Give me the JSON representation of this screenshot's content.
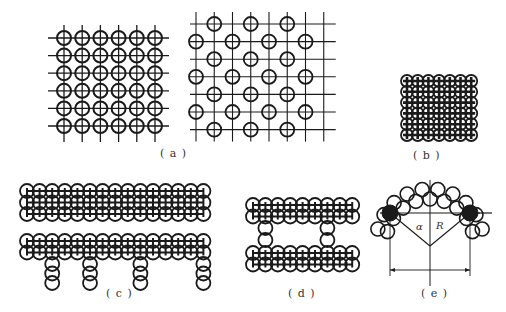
{
  "figure": {
    "background": "#ffffff",
    "stroke": "#1a1a1a",
    "panels": [
      {
        "id": "a",
        "label": "( a )",
        "description": "Square grid arrangements: dense 6x6 and staggered grid"
      },
      {
        "id": "b",
        "label": "( b )",
        "description": "Closely packed 6x6 circle array"
      },
      {
        "id": "c",
        "label": "( c )",
        "description": "Three-row strip and two-row strip with four legs"
      },
      {
        "id": "d",
        "label": "( d )",
        "description": "Two double-row strips connected by two vertical legs"
      },
      {
        "id": "e",
        "label": "( e )",
        "description": "Circles arranged along an arc of radius R with angle alpha"
      }
    ],
    "annotations": {
      "alpha": "α",
      "radius": "R"
    },
    "params": {
      "a_left": {
        "x0": 64,
        "y0": 38,
        "dx": 18.2,
        "dy": 17.6,
        "cols": 6,
        "rows": 6,
        "r": 7
      },
      "a_right": {
        "x0": 196,
        "y0": 24,
        "dx": 36.5,
        "dy": 17.6,
        "cols": 4,
        "rows": 7,
        "r": 7
      },
      "b": {
        "x0": 407,
        "y0": 81,
        "dx": 10.7,
        "dy": 10.8,
        "cols": 7,
        "rows": 6,
        "r": 6
      },
      "c_top": {
        "x0": 27,
        "y0": 191,
        "dx": 12.6,
        "dy": 11.5,
        "cols": 15,
        "rows": 3,
        "r": 7
      },
      "c_bot": {
        "x0": 27,
        "y0": 241,
        "dx": 12.6,
        "dy": 11.5,
        "cols": 15,
        "rows": 2,
        "r": 7,
        "legs": [
          2,
          5,
          9,
          14
        ],
        "leg_len": 3
      },
      "d_top": {
        "x0": 253,
        "y0": 205,
        "dx": 12.4,
        "dy": 11.5,
        "cols": 9,
        "rows": 2,
        "r": 7
      },
      "d_bot": {
        "x0": 253,
        "y0": 253,
        "dx": 12.4,
        "dy": 11.5,
        "cols": 9,
        "rows": 2,
        "r": 7,
        "legs": [
          1,
          6
        ],
        "leg_span": [
          228,
          240
        ]
      },
      "e": {
        "cx": 430,
        "cy": 248,
        "R": 50,
        "n": 10,
        "r": 7,
        "span_deg": 150
      }
    }
  }
}
